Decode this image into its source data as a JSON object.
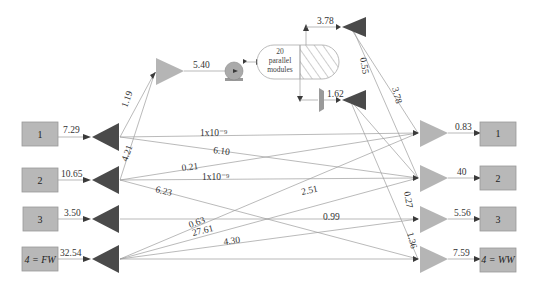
{
  "sources": [
    {
      "label": "1",
      "italic": false,
      "flow": "7.29",
      "y": 137
    },
    {
      "label": "2",
      "italic": false,
      "flow": "10.65",
      "y": 180
    },
    {
      "label": "3",
      "italic": false,
      "flow": "3.50",
      "y": 219
    },
    {
      "label": "4 = FW",
      "italic": true,
      "flow": "32.54",
      "y": 259
    }
  ],
  "sinks": [
    {
      "label": "1",
      "italic": false,
      "flow": "0.83",
      "y": 133
    },
    {
      "label": "2",
      "italic": false,
      "flow": "40",
      "y": 178
    },
    {
      "label": "3",
      "italic": false,
      "flow": "5.56",
      "y": 219
    },
    {
      "label": "4 = WW",
      "italic": true,
      "flow": "7.59",
      "y": 259
    }
  ],
  "regeneration": {
    "mixer_inflow_labels": [
      "1.19",
      "4.21"
    ],
    "pump_flow": "5.40",
    "module_text": [
      "20",
      "parallel",
      "modules"
    ],
    "permeate_flow": "3.78",
    "reject_flow": "1.62",
    "permeate_split_labels": [
      "0.55",
      "3.78"
    ],
    "reject_split_labels": [
      "0.27",
      "1.36"
    ]
  },
  "network_flows": {
    "s1_to_k1": "1x10⁻⁹",
    "s1_to_k2": "6.10",
    "s3_to_k1": "0.21",
    "s2_to_k2": "1x10⁻⁹",
    "s2_to_k4": "6.23",
    "s4_to_k1": "2.51",
    "s4_to_k2": "0.63",
    "s4_to_k3": "27.61",
    "s4_to_k4": "4.30",
    "s3_to_k3": "0.99"
  },
  "colors": {
    "box": "#b8b8b8",
    "source_splitter": "#4a4a4a",
    "sink_mixer": "#b5b5b5",
    "edge": "#9c9c9c"
  }
}
